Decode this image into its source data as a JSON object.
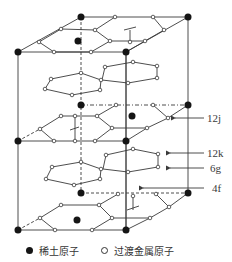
{
  "diagram": {
    "site_labels": [
      {
        "text": "12j",
        "x": 207,
        "y": 122,
        "arrow_from": [
          204,
          118
        ],
        "arrow_to": [
          175,
          118
        ]
      },
      {
        "text": "12k",
        "x": 207,
        "y": 157,
        "arrow_from": [
          204,
          153
        ],
        "arrow_to": [
          170,
          153
        ]
      },
      {
        "text": "6g",
        "x": 210,
        "y": 172,
        "arrow_from": [
          204,
          168
        ],
        "arrow_to": [
          170,
          168
        ]
      },
      {
        "text": "4f",
        "x": 212,
        "y": 192,
        "arrow_from": [
          204,
          188
        ],
        "arrow_to": [
          143,
          188
        ]
      }
    ],
    "colors": {
      "rare_earth": "#151515",
      "transition_metal": "#ffffff",
      "line": "#3a3a3a"
    }
  },
  "legend": {
    "rare_earth_label": "稀土原子",
    "transition_metal_label": "过渡金属原子"
  }
}
